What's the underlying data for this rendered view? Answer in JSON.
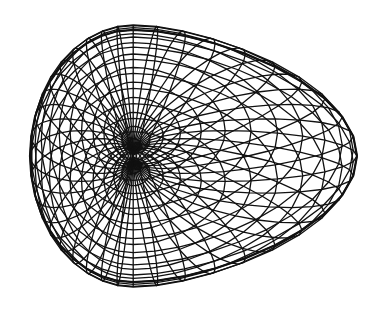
{
  "figure": {
    "title": "Wireframe surface",
    "background": "#ffffff",
    "line_color": "#111111"
  },
  "mesh": {
    "u_segments": 40,
    "v_segments": 28,
    "hole_center": [
      128,
      155
    ],
    "bounds": {
      "x_min": 30,
      "x_max": 357,
      "y_min": 25,
      "y_max": 287
    }
  }
}
